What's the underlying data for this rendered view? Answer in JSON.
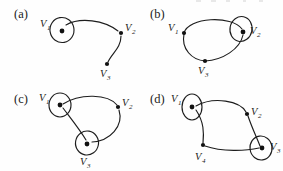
{
  "figure": {
    "background_color": "#fefefe",
    "ink_color": "#1d1d1d",
    "width": 283,
    "height": 171
  },
  "panels": [
    {
      "id": "a",
      "label": "(a)",
      "label_x": 14,
      "label_y": 18,
      "vertices": [
        {
          "id": "v1",
          "label": "V",
          "sub": "1",
          "x": 62,
          "y": 31,
          "loop": true,
          "loop_rx": 12,
          "loop_ry": 12.5,
          "loop_cx": 62,
          "loop_cy": 30,
          "loop_rot": -10,
          "label_x": 40,
          "label_y": 27
        },
        {
          "id": "v2",
          "label": "V",
          "sub": "2",
          "x": 121,
          "y": 33,
          "loop": false,
          "label_x": 125,
          "label_y": 31
        },
        {
          "id": "v3",
          "label": "V",
          "sub": "3",
          "x": 107,
          "y": 64,
          "loop": false,
          "label_x": 100,
          "label_y": 77
        }
      ],
      "edges": [
        {
          "from": "v1",
          "to": "v2",
          "kind": "arc"
        },
        {
          "from": "v2",
          "to": "v3",
          "kind": "arc"
        }
      ]
    },
    {
      "id": "b",
      "label": "(b)",
      "label_x": 150,
      "label_y": 18,
      "vertices": [
        {
          "id": "v1",
          "label": "V",
          "sub": "1",
          "x": 184,
          "y": 33,
          "loop": false,
          "label_x": 170,
          "label_y": 31
        },
        {
          "id": "v2",
          "label": "V",
          "sub": "2",
          "x": 243,
          "y": 32,
          "loop": true,
          "loop_rx": 11,
          "loop_ry": 12.5,
          "loop_cx": 241,
          "loop_cy": 29,
          "loop_rot": 12,
          "label_x": 250,
          "label_y": 34
        },
        {
          "id": "v3",
          "label": "V",
          "sub": "3",
          "x": 205,
          "y": 61,
          "loop": false,
          "label_x": 200,
          "label_y": 74
        }
      ],
      "edges": [
        {
          "from": "v1",
          "to": "v2",
          "kind": "upper-arc"
        },
        {
          "from": "v1",
          "to": "v3",
          "kind": "lower-arc"
        },
        {
          "from": "v3",
          "to": "v2",
          "kind": "lower-arc"
        }
      ]
    },
    {
      "id": "c",
      "label": "(c)",
      "label_x": 14,
      "label_y": 103,
      "vertices": [
        {
          "id": "v1",
          "label": "V",
          "sub": "1",
          "x": 60,
          "y": 105,
          "loop": true,
          "loop_rx": 11,
          "loop_ry": 12,
          "loop_cx": 60,
          "loop_cy": 105,
          "loop_rot": 0,
          "label_x": 40,
          "label_y": 101
        },
        {
          "id": "v2",
          "label": "V",
          "sub": "2",
          "x": 118,
          "y": 107,
          "loop": false,
          "label_x": 122,
          "label_y": 106
        },
        {
          "id": "v3",
          "label": "V",
          "sub": "3",
          "x": 87,
          "y": 144,
          "loop": true,
          "loop_rx": 11.5,
          "loop_ry": 12,
          "loop_cx": 87,
          "loop_cy": 143,
          "loop_rot": 10,
          "label_x": 81,
          "label_y": 165
        }
      ],
      "edges": [
        {
          "from": "v1",
          "to": "v2",
          "kind": "arc"
        },
        {
          "from": "v1",
          "to": "v3",
          "kind": "arc"
        },
        {
          "from": "v2",
          "to": "v3",
          "kind": "arc"
        }
      ]
    },
    {
      "id": "d",
      "label": "(d)",
      "label_x": 150,
      "label_y": 103,
      "vertices": [
        {
          "id": "v1",
          "label": "V",
          "sub": "1",
          "x": 192,
          "y": 107,
          "loop": true,
          "loop_rx": 10,
          "loop_ry": 13,
          "loop_cx": 192,
          "loop_cy": 107,
          "loop_rot": 0,
          "label_x": 172,
          "label_y": 102
        },
        {
          "id": "v2",
          "label": "V",
          "sub": "2",
          "x": 247,
          "y": 114,
          "loop": false,
          "label_x": 251,
          "label_y": 115
        },
        {
          "id": "v3",
          "label": "V",
          "sub": "3",
          "x": 262,
          "y": 148,
          "loop": true,
          "loop_rx": 11,
          "loop_ry": 12,
          "loop_cx": 261,
          "loop_cy": 148,
          "loop_rot": -8,
          "label_x": 270,
          "label_y": 150
        },
        {
          "id": "v4",
          "label": "V",
          "sub": "4",
          "x": 203,
          "y": 145,
          "loop": false,
          "label_x": 196,
          "label_y": 160
        }
      ],
      "edges": [
        {
          "from": "v1",
          "to": "v2",
          "kind": "arc"
        },
        {
          "from": "v1",
          "to": "v4",
          "kind": "arc"
        },
        {
          "from": "v2",
          "to": "v3",
          "kind": "arc"
        },
        {
          "from": "v4",
          "to": "v3",
          "kind": "arc"
        }
      ]
    }
  ]
}
